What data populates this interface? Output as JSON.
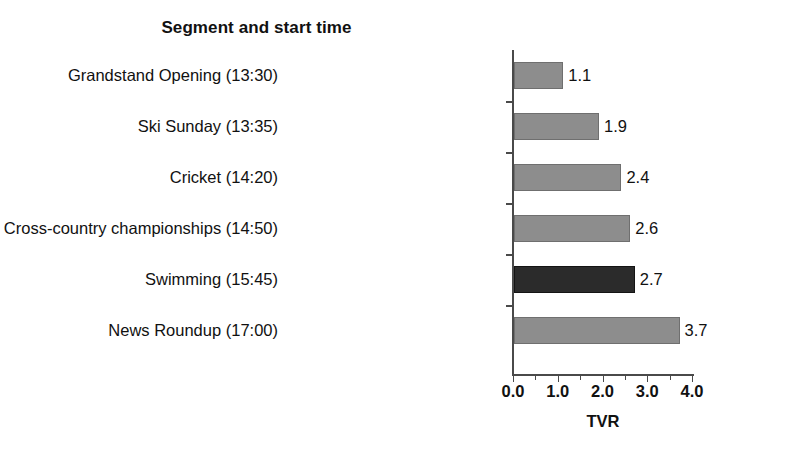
{
  "chart_data": {
    "type": "bar",
    "orientation": "horizontal",
    "title": "Segment and start time",
    "xlabel": "TVR",
    "ylabel": "",
    "categories": [
      "Grandstand Opening (13:30)",
      "Ski Sunday (13:35)",
      "Cricket (14:20)",
      "European Cross-country championships (14:50)",
      "Swimming (15:45)",
      "News Roundup (17:00)"
    ],
    "values": [
      1.1,
      1.9,
      2.4,
      2.6,
      2.7,
      3.7
    ],
    "value_labels": [
      "1.1",
      "1.9",
      "2.4",
      "2.6",
      "2.7",
      "3.7"
    ],
    "bar_colors": [
      "#8d8d8d",
      "#8d8d8d",
      "#8d8d8d",
      "#8d8d8d",
      "#2b2b2b",
      "#8d8d8d"
    ],
    "highlighted_category": "Swimming (15:45)",
    "xlim": [
      0.0,
      4.0
    ],
    "xticks": [
      0.0,
      1.0,
      2.0,
      3.0,
      4.0
    ],
    "xtick_labels": [
      "0.0",
      "1.0",
      "2.0",
      "3.0",
      "4.0"
    ],
    "xticks_minor": [
      0.5,
      1.5,
      2.5,
      3.5
    ],
    "grid": false,
    "legend": null,
    "colors": {
      "bar_gray": "#8d8d8d",
      "bar_dark": "#2b2b2b",
      "axis": "#4a4a4a",
      "text": "#111111",
      "background": "#ffffff"
    }
  }
}
